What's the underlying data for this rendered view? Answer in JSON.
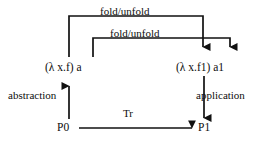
{
  "diagram": {
    "stroke_color": "#111111",
    "background_color": "#ffffff",
    "nodes": [
      {
        "id": "lambda-xf",
        "label": "(λ x.f) a",
        "x": 45,
        "y": 62
      },
      {
        "id": "lambda-xf1",
        "label": "(λ x.f1) a1",
        "x": 176,
        "y": 62
      },
      {
        "id": "p0",
        "label": "P0",
        "x": 57,
        "y": 122
      },
      {
        "id": "p1",
        "label": "P1",
        "x": 198,
        "y": 122
      }
    ],
    "edges": [
      {
        "id": "fold-unfold-outer",
        "label": "fold/unfold",
        "from": "lambda-xf",
        "to": "lambda-xf1",
        "direction": "right",
        "style": "bracket-top"
      },
      {
        "id": "fold-unfold-inner",
        "label": "fold/unfold",
        "from": "a",
        "to": "a1",
        "direction": "right",
        "style": "bracket-top"
      },
      {
        "id": "abstraction",
        "label": "abstraction",
        "from": "p0",
        "to": "lambda-xf",
        "direction": "up",
        "style": "straight"
      },
      {
        "id": "application",
        "label": "application",
        "from": "lambda-xf1",
        "to": "p1",
        "direction": "down",
        "style": "straight"
      },
      {
        "id": "tr",
        "label": "Tr",
        "from": "p0",
        "to": "p1",
        "direction": "right",
        "style": "straight"
      }
    ]
  }
}
